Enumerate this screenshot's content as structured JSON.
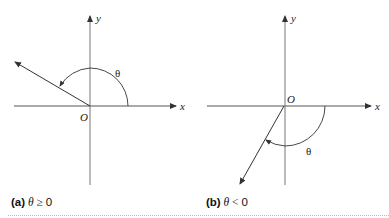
{
  "figure": {
    "panels": [
      {
        "id": "a",
        "axes": {
          "x_label": "x",
          "y_label": "y",
          "origin_label": "O"
        },
        "angle_label": "θ",
        "angle_direction": "counterclockwise",
        "caption": {
          "tag": "(a)",
          "variable": "θ",
          "relation": "≥",
          "value": "0"
        }
      },
      {
        "id": "b",
        "axes": {
          "x_label": "x",
          "y_label": "y",
          "origin_label": "O"
        },
        "angle_label": "θ",
        "angle_direction": "clockwise",
        "caption": {
          "tag": "(b)",
          "variable": "θ",
          "relation": "<",
          "value": "0"
        }
      }
    ],
    "colors": {
      "line": "#333333",
      "axis": "#555555",
      "background": "#ffffff"
    }
  }
}
